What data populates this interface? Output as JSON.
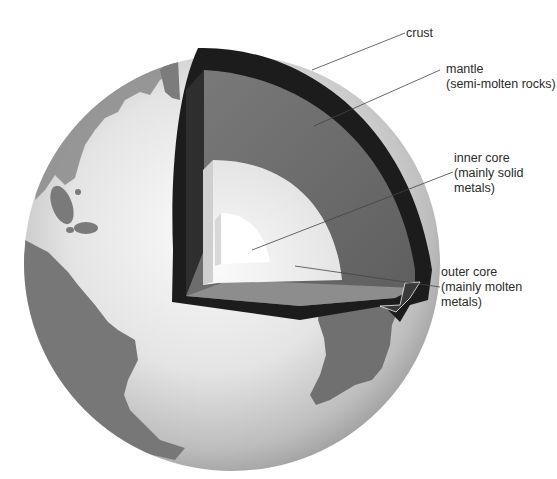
{
  "diagram": {
    "labels": [
      {
        "id": "crust",
        "lines": [
          "crust"
        ]
      },
      {
        "id": "mantle",
        "lines": [
          "mantle",
          "(semi-molten rocks)"
        ]
      },
      {
        "id": "inner_core",
        "lines": [
          "inner core",
          "(mainly solid",
          "metals)"
        ]
      },
      {
        "id": "outer_core",
        "lines": [
          "outer core",
          "(mainly molten",
          "metals)"
        ]
      }
    ],
    "colors": {
      "background": "#ffffff",
      "ocean": "#e6e6e6",
      "land": "#6e6e6e",
      "crust": "#1c1c1c",
      "mantle": "#6a6a6a",
      "outer_core": "#eeeeee",
      "inner_core": "#ffffff",
      "leader_line": "#444444",
      "text": "#2a2a2a"
    }
  }
}
